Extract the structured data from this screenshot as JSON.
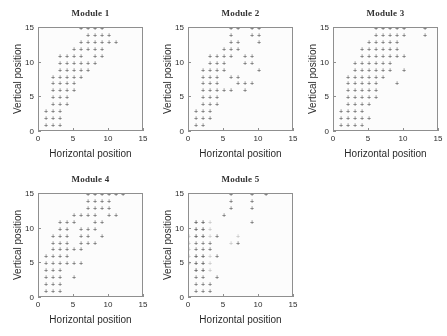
{
  "figure": {
    "panel_titles": [
      "Module 1",
      "Module 2",
      "Module 3",
      "Module 4",
      "Module 5"
    ],
    "xlabel": "Horizontal position",
    "ylabel": "Vertical position",
    "tick_labels_x": [
      "0",
      "5",
      "10",
      "15"
    ],
    "tick_labels_y": [
      "0",
      "5",
      "10",
      "15"
    ],
    "marker_glyph": "+",
    "colors": {
      "background": "#ffffff",
      "axis": "#8d8d8d",
      "marker": "#3a3a3a",
      "marker_faint": "#b6b6b6",
      "text": "#1f1f1f",
      "title": "#2b2b2b"
    }
  },
  "chart_data": [
    {
      "type": "scatter",
      "title": "Module 1",
      "xlabel": "Horizontal position",
      "ylabel": "Vertical position",
      "xlim": [
        0,
        15
      ],
      "ylim": [
        0,
        15
      ],
      "xticks": [
        0,
        5,
        10,
        15
      ],
      "yticks": [
        0,
        5,
        10,
        15
      ],
      "grid": false,
      "legend": "none",
      "marker": "+",
      "points": [
        [
          1,
          0
        ],
        [
          2,
          0
        ],
        [
          3,
          0
        ],
        [
          1,
          1
        ],
        [
          2,
          1
        ],
        [
          3,
          1
        ],
        [
          1,
          2
        ],
        [
          2,
          2
        ],
        [
          3,
          2
        ],
        [
          1,
          3
        ],
        [
          2,
          3
        ],
        [
          3,
          3
        ],
        [
          2,
          4
        ],
        [
          3,
          4
        ],
        [
          4,
          4
        ],
        [
          2,
          5
        ],
        [
          3,
          5
        ],
        [
          4,
          5
        ],
        [
          2,
          6
        ],
        [
          3,
          6
        ],
        [
          4,
          6
        ],
        [
          5,
          6
        ],
        [
          2,
          7
        ],
        [
          3,
          7
        ],
        [
          4,
          7
        ],
        [
          5,
          7
        ],
        [
          2,
          8
        ],
        [
          3,
          8
        ],
        [
          4,
          8
        ],
        [
          5,
          8
        ],
        [
          6,
          8
        ],
        [
          3,
          9
        ],
        [
          4,
          9
        ],
        [
          5,
          9
        ],
        [
          6,
          9
        ],
        [
          7,
          9
        ],
        [
          3,
          10
        ],
        [
          4,
          10
        ],
        [
          5,
          10
        ],
        [
          6,
          10
        ],
        [
          7,
          10
        ],
        [
          8,
          10
        ],
        [
          3,
          11
        ],
        [
          4,
          11
        ],
        [
          5,
          11
        ],
        [
          6,
          11
        ],
        [
          8,
          11
        ],
        [
          9,
          11
        ],
        [
          5,
          12
        ],
        [
          6,
          12
        ],
        [
          7,
          12
        ],
        [
          8,
          12
        ],
        [
          9,
          12
        ],
        [
          6,
          13
        ],
        [
          7,
          13
        ],
        [
          8,
          13
        ],
        [
          9,
          13
        ],
        [
          10,
          13
        ],
        [
          11,
          13
        ],
        [
          7,
          14
        ],
        [
          8,
          14
        ],
        [
          9,
          14
        ],
        [
          10,
          14
        ],
        [
          6,
          15
        ],
        [
          7,
          15
        ],
        [
          8,
          15
        ],
        [
          9,
          15
        ]
      ]
    },
    {
      "type": "scatter",
      "title": "Module 2",
      "xlabel": "Horizontal position",
      "ylabel": "Vertical position",
      "xlim": [
        0,
        15
      ],
      "ylim": [
        0,
        15
      ],
      "xticks": [
        0,
        5,
        10,
        15
      ],
      "yticks": [
        0,
        5,
        10,
        15
      ],
      "grid": false,
      "legend": "none",
      "marker": "+",
      "points": [
        [
          0,
          0
        ],
        [
          1,
          0
        ],
        [
          1,
          1
        ],
        [
          2,
          1
        ],
        [
          1,
          2
        ],
        [
          2,
          2
        ],
        [
          3,
          2
        ],
        [
          1,
          3
        ],
        [
          2,
          3
        ],
        [
          3,
          3
        ],
        [
          2,
          4
        ],
        [
          3,
          4
        ],
        [
          4,
          4
        ],
        [
          2,
          5
        ],
        [
          3,
          5
        ],
        [
          4,
          5
        ],
        [
          2,
          6
        ],
        [
          3,
          6
        ],
        [
          4,
          6
        ],
        [
          5,
          6
        ],
        [
          6,
          6
        ],
        [
          8,
          6
        ],
        [
          2,
          7
        ],
        [
          3,
          7
        ],
        [
          4,
          7
        ],
        [
          7,
          7
        ],
        [
          8,
          7
        ],
        [
          9,
          7
        ],
        [
          2,
          8
        ],
        [
          3,
          8
        ],
        [
          4,
          8
        ],
        [
          6,
          8
        ],
        [
          7,
          8
        ],
        [
          2,
          9
        ],
        [
          3,
          9
        ],
        [
          4,
          9
        ],
        [
          5,
          9
        ],
        [
          10,
          9
        ],
        [
          3,
          10
        ],
        [
          4,
          10
        ],
        [
          5,
          10
        ],
        [
          8,
          10
        ],
        [
          9,
          10
        ],
        [
          3,
          11
        ],
        [
          4,
          11
        ],
        [
          5,
          11
        ],
        [
          6,
          11
        ],
        [
          8,
          11
        ],
        [
          9,
          11
        ],
        [
          5,
          12
        ],
        [
          6,
          12
        ],
        [
          7,
          12
        ],
        [
          6,
          13
        ],
        [
          7,
          13
        ],
        [
          10,
          13
        ],
        [
          6,
          14
        ],
        [
          9,
          14
        ],
        [
          10,
          14
        ],
        [
          6,
          15
        ],
        [
          7,
          15
        ],
        [
          9,
          15
        ],
        [
          10,
          15
        ]
      ]
    },
    {
      "type": "scatter",
      "title": "Module 3",
      "xlabel": "Horizontal position",
      "ylabel": "Vertical position",
      "xlim": [
        0,
        15
      ],
      "ylim": [
        0,
        15
      ],
      "xticks": [
        0,
        5,
        10,
        15
      ],
      "yticks": [
        0,
        5,
        10,
        15
      ],
      "grid": false,
      "legend": "none",
      "marker": "+",
      "points": [
        [
          1,
          0
        ],
        [
          2,
          0
        ],
        [
          3,
          0
        ],
        [
          4,
          0
        ],
        [
          1,
          1
        ],
        [
          2,
          1
        ],
        [
          3,
          1
        ],
        [
          4,
          1
        ],
        [
          1,
          2
        ],
        [
          2,
          2
        ],
        [
          3,
          2
        ],
        [
          4,
          2
        ],
        [
          5,
          2
        ],
        [
          1,
          3
        ],
        [
          2,
          3
        ],
        [
          3,
          3
        ],
        [
          4,
          3
        ],
        [
          2,
          4
        ],
        [
          3,
          4
        ],
        [
          4,
          4
        ],
        [
          5,
          4
        ],
        [
          2,
          5
        ],
        [
          3,
          5
        ],
        [
          4,
          5
        ],
        [
          5,
          5
        ],
        [
          6,
          5
        ],
        [
          2,
          6
        ],
        [
          3,
          6
        ],
        [
          4,
          6
        ],
        [
          5,
          6
        ],
        [
          6,
          6
        ],
        [
          2,
          7
        ],
        [
          3,
          7
        ],
        [
          4,
          7
        ],
        [
          5,
          7
        ],
        [
          6,
          7
        ],
        [
          9,
          7
        ],
        [
          2,
          8
        ],
        [
          3,
          8
        ],
        [
          4,
          8
        ],
        [
          5,
          8
        ],
        [
          6,
          8
        ],
        [
          7,
          8
        ],
        [
          3,
          9
        ],
        [
          4,
          9
        ],
        [
          5,
          9
        ],
        [
          6,
          9
        ],
        [
          7,
          9
        ],
        [
          8,
          9
        ],
        [
          10,
          9
        ],
        [
          3,
          10
        ],
        [
          4,
          10
        ],
        [
          5,
          10
        ],
        [
          6,
          10
        ],
        [
          7,
          10
        ],
        [
          8,
          10
        ],
        [
          4,
          11
        ],
        [
          5,
          11
        ],
        [
          6,
          11
        ],
        [
          7,
          11
        ],
        [
          8,
          11
        ],
        [
          9,
          11
        ],
        [
          10,
          11
        ],
        [
          4,
          12
        ],
        [
          5,
          12
        ],
        [
          6,
          12
        ],
        [
          7,
          12
        ],
        [
          8,
          12
        ],
        [
          9,
          12
        ],
        [
          5,
          13
        ],
        [
          6,
          13
        ],
        [
          7,
          13
        ],
        [
          8,
          13
        ],
        [
          9,
          13
        ],
        [
          6,
          14
        ],
        [
          7,
          14
        ],
        [
          8,
          14
        ],
        [
          9,
          14
        ],
        [
          10,
          14
        ],
        [
          13,
          14
        ],
        [
          6,
          15
        ],
        [
          7,
          15
        ],
        [
          8,
          15
        ],
        [
          9,
          15
        ],
        [
          10,
          15
        ],
        [
          13,
          15
        ],
        [
          15,
          15
        ]
      ]
    },
    {
      "type": "scatter",
      "title": "Module 4",
      "xlabel": "Horizontal position",
      "ylabel": "Vertical position",
      "xlim": [
        0,
        15
      ],
      "ylim": [
        0,
        15
      ],
      "xticks": [
        0,
        5,
        10,
        15
      ],
      "yticks": [
        0,
        5,
        10,
        15
      ],
      "grid": false,
      "legend": "none",
      "marker": "+",
      "points": [
        [
          1,
          0
        ],
        [
          2,
          0
        ],
        [
          1,
          1
        ],
        [
          2,
          1
        ],
        [
          3,
          1
        ],
        [
          1,
          2
        ],
        [
          2,
          2
        ],
        [
          3,
          2
        ],
        [
          1,
          3
        ],
        [
          2,
          3
        ],
        [
          3,
          3
        ],
        [
          5,
          3
        ],
        [
          1,
          4
        ],
        [
          2,
          4
        ],
        [
          3,
          4
        ],
        [
          1,
          5
        ],
        [
          2,
          5
        ],
        [
          3,
          5
        ],
        [
          4,
          5
        ],
        [
          5,
          5
        ],
        [
          6,
          5
        ],
        [
          1,
          6
        ],
        [
          2,
          6
        ],
        [
          3,
          6
        ],
        [
          4,
          6
        ],
        [
          2,
          7
        ],
        [
          3,
          7
        ],
        [
          4,
          7
        ],
        [
          5,
          7
        ],
        [
          6,
          7
        ],
        [
          2,
          8
        ],
        [
          3,
          8
        ],
        [
          4,
          8
        ],
        [
          6,
          8
        ],
        [
          7,
          8
        ],
        [
          8,
          8
        ],
        [
          2,
          9
        ],
        [
          3,
          9
        ],
        [
          4,
          9
        ],
        [
          6,
          9
        ],
        [
          7,
          9
        ],
        [
          9,
          9
        ],
        [
          3,
          10
        ],
        [
          4,
          10
        ],
        [
          6,
          10
        ],
        [
          7,
          10
        ],
        [
          8,
          10
        ],
        [
          3,
          11
        ],
        [
          4,
          11
        ],
        [
          5,
          11
        ],
        [
          8,
          11
        ],
        [
          9,
          11
        ],
        [
          5,
          12
        ],
        [
          6,
          12
        ],
        [
          7,
          12
        ],
        [
          8,
          12
        ],
        [
          10,
          12
        ],
        [
          11,
          12
        ],
        [
          7,
          13
        ],
        [
          8,
          13
        ],
        [
          9,
          13
        ],
        [
          10,
          13
        ],
        [
          7,
          14
        ],
        [
          8,
          14
        ],
        [
          9,
          14
        ],
        [
          10,
          14
        ],
        [
          7,
          15
        ],
        [
          8,
          15
        ],
        [
          9,
          15
        ],
        [
          10,
          15
        ],
        [
          11,
          15
        ],
        [
          12,
          15
        ]
      ]
    },
    {
      "type": "scatter",
      "title": "Module 5",
      "xlabel": "Horizontal position",
      "ylabel": "Vertical position",
      "xlim": [
        0,
        15
      ],
      "ylim": [
        0,
        15
      ],
      "xticks": [
        0,
        5,
        10,
        15
      ],
      "yticks": [
        0,
        5,
        10,
        15
      ],
      "grid": false,
      "legend": "none",
      "marker": "+",
      "points": [
        [
          0,
          0
        ],
        [
          1,
          0
        ],
        [
          2,
          0
        ],
        [
          1,
          1
        ],
        [
          2,
          1
        ],
        [
          3,
          1
        ],
        [
          1,
          2
        ],
        [
          2,
          2
        ],
        [
          3,
          2
        ],
        [
          1,
          3
        ],
        [
          2,
          3
        ],
        [
          4,
          3
        ],
        [
          1,
          4
        ],
        [
          2,
          4
        ],
        [
          1,
          5
        ],
        [
          2,
          5
        ],
        [
          1,
          6
        ],
        [
          2,
          6
        ],
        [
          4,
          6
        ],
        [
          1,
          7
        ],
        [
          2,
          7
        ],
        [
          3,
          7
        ],
        [
          1,
          8
        ],
        [
          2,
          8
        ],
        [
          3,
          8
        ],
        [
          7,
          8
        ],
        [
          1,
          9
        ],
        [
          2,
          9
        ],
        [
          4,
          9
        ],
        [
          1,
          10
        ],
        [
          2,
          10
        ],
        [
          1,
          11
        ],
        [
          2,
          11
        ],
        [
          9,
          11
        ],
        [
          5,
          12
        ],
        [
          6,
          13
        ],
        [
          9,
          13
        ],
        [
          6,
          14
        ],
        [
          9,
          14
        ],
        [
          6,
          15
        ],
        [
          9,
          15
        ],
        [
          11,
          15
        ]
      ],
      "faint_points": [
        [
          1,
          4
        ],
        [
          2,
          4
        ],
        [
          3,
          4
        ],
        [
          1,
          5
        ],
        [
          2,
          5
        ],
        [
          3,
          5
        ],
        [
          1,
          6
        ],
        [
          2,
          6
        ],
        [
          3,
          6
        ],
        [
          1,
          9
        ],
        [
          2,
          9
        ],
        [
          3,
          9
        ],
        [
          1,
          10
        ],
        [
          2,
          10
        ],
        [
          3,
          10
        ],
        [
          1,
          11
        ],
        [
          2,
          11
        ],
        [
          3,
          11
        ],
        [
          0,
          5
        ],
        [
          0,
          6
        ],
        [
          0,
          7
        ],
        [
          0,
          8
        ],
        [
          0,
          9
        ],
        [
          6,
          8
        ],
        [
          7,
          9
        ]
      ]
    }
  ]
}
